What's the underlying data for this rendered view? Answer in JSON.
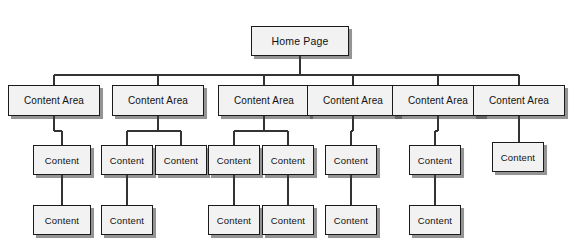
{
  "diagram": {
    "type": "sitemap-tree",
    "title_text": "Website Sitemap Hierarchy",
    "background_color": "#ffffff",
    "node_fill_color": "#f2f2f2",
    "node_border_color": "#1b1b1b",
    "connector_color": "#333333",
    "levels": 4,
    "root": {
      "label": "Home Page"
    },
    "level2_label": "Content Area",
    "level3_label": "Content",
    "level4_label": "Content",
    "nodes": [
      {
        "id": "root",
        "label": "Home Page",
        "level": 1,
        "x": 251,
        "y": 26,
        "w": 98,
        "h": 30
      },
      {
        "id": "a1",
        "label": "Content Area",
        "level": 2,
        "x": 8,
        "y": 85,
        "w": 92,
        "h": 31
      },
      {
        "id": "a2",
        "label": "Content Area",
        "level": 2,
        "x": 112,
        "y": 85,
        "w": 92,
        "h": 31
      },
      {
        "id": "a3",
        "label": "Content Area",
        "level": 2,
        "x": 218,
        "y": 85,
        "w": 92,
        "h": 31
      },
      {
        "id": "a4",
        "label": "Content Area",
        "level": 2,
        "x": 307,
        "y": 85,
        "w": 92,
        "h": 31
      },
      {
        "id": "a5",
        "label": "Content Area",
        "level": 2,
        "x": 392,
        "y": 85,
        "w": 92,
        "h": 31
      },
      {
        "id": "a6",
        "label": "Content Area",
        "level": 2,
        "x": 473,
        "y": 85,
        "w": 92,
        "h": 31
      },
      {
        "id": "c1",
        "label": "Content",
        "level": 3,
        "x": 33,
        "y": 145,
        "w": 58,
        "h": 30
      },
      {
        "id": "c2a",
        "label": "Content",
        "level": 3,
        "x": 101,
        "y": 145,
        "w": 52,
        "h": 30
      },
      {
        "id": "c2b",
        "label": "Content",
        "level": 3,
        "x": 155,
        "y": 145,
        "w": 52,
        "h": 30
      },
      {
        "id": "c3a",
        "label": "Content",
        "level": 3,
        "x": 208,
        "y": 145,
        "w": 52,
        "h": 30
      },
      {
        "id": "c3b",
        "label": "Content",
        "level": 3,
        "x": 262,
        "y": 145,
        "w": 52,
        "h": 30
      },
      {
        "id": "c4",
        "label": "Content",
        "level": 3,
        "x": 325,
        "y": 145,
        "w": 52,
        "h": 30
      },
      {
        "id": "c5",
        "label": "Content",
        "level": 3,
        "x": 409,
        "y": 145,
        "w": 52,
        "h": 30
      },
      {
        "id": "c6",
        "label": "Content",
        "level": 3,
        "x": 492,
        "y": 142,
        "w": 52,
        "h": 30
      },
      {
        "id": "d1",
        "label": "Content",
        "level": 4,
        "x": 33,
        "y": 205,
        "w": 58,
        "h": 30
      },
      {
        "id": "d2",
        "label": "Content",
        "level": 4,
        "x": 101,
        "y": 205,
        "w": 52,
        "h": 30
      },
      {
        "id": "d3a",
        "label": "Content",
        "level": 4,
        "x": 208,
        "y": 205,
        "w": 52,
        "h": 30
      },
      {
        "id": "d3b",
        "label": "Content",
        "level": 4,
        "x": 262,
        "y": 205,
        "w": 52,
        "h": 30
      },
      {
        "id": "d4",
        "label": "Content",
        "level": 4,
        "x": 325,
        "y": 205,
        "w": 52,
        "h": 30
      },
      {
        "id": "d5",
        "label": "Content",
        "level": 4,
        "x": 409,
        "y": 205,
        "w": 52,
        "h": 30
      }
    ],
    "edges": [
      {
        "from": "root",
        "to": "a1"
      },
      {
        "from": "root",
        "to": "a2"
      },
      {
        "from": "root",
        "to": "a3"
      },
      {
        "from": "root",
        "to": "a4"
      },
      {
        "from": "root",
        "to": "a5"
      },
      {
        "from": "root",
        "to": "a6"
      },
      {
        "from": "a1",
        "to": "c1"
      },
      {
        "from": "a2",
        "to": "c2a"
      },
      {
        "from": "a2",
        "to": "c2b"
      },
      {
        "from": "a3",
        "to": "c3a"
      },
      {
        "from": "a3",
        "to": "c3b"
      },
      {
        "from": "a4",
        "to": "c4"
      },
      {
        "from": "a5",
        "to": "c5"
      },
      {
        "from": "a6",
        "to": "c6"
      },
      {
        "from": "c1",
        "to": "d1"
      },
      {
        "from": "c2a",
        "to": "d2"
      },
      {
        "from": "c3a",
        "to": "d3a"
      },
      {
        "from": "c3b",
        "to": "d3b"
      },
      {
        "from": "c4",
        "to": "d4"
      },
      {
        "from": "c5",
        "to": "d5"
      }
    ]
  }
}
